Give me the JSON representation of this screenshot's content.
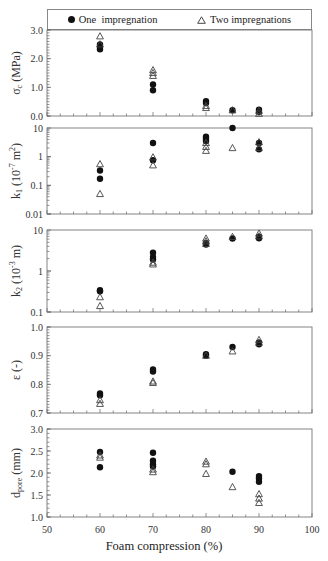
{
  "legend": {
    "series_one": "One  impregnation",
    "series_two": "Two impregnations"
  },
  "x_axis": {
    "label": "Foam compression (%)",
    "ticks": [
      "50",
      "60",
      "70",
      "80",
      "90",
      "100"
    ]
  },
  "chart_data": [
    {
      "type": "scatter",
      "title": "",
      "ylabel": "σc (MPa)",
      "xlabel": "Foam compression (%)",
      "xlim": [
        50,
        100
      ],
      "ylim": [
        0.0,
        3.0
      ],
      "yscale": "linear",
      "yticks": [
        "0.0",
        "1.0",
        "2.0",
        "3.0"
      ],
      "grid": false,
      "legend_position": "top",
      "series": [
        {
          "name": "One  impregnation",
          "marker": "filled-circle",
          "x": [
            60,
            60,
            60,
            70,
            70,
            80,
            80,
            85,
            90,
            90
          ],
          "y": [
            2.33,
            2.42,
            2.5,
            1.1,
            0.9,
            0.52,
            0.45,
            0.2,
            0.22,
            0.15
          ]
        },
        {
          "name": "Two impregnations",
          "marker": "open-triangle",
          "x": [
            60,
            60,
            70,
            70,
            70,
            80,
            80,
            85,
            90,
            90
          ],
          "y": [
            2.78,
            2.5,
            1.6,
            1.5,
            1.4,
            0.35,
            0.28,
            0.2,
            0.18,
            0.08
          ]
        }
      ]
    },
    {
      "type": "scatter",
      "ylabel": "k1 (10⁻⁷ m²)",
      "xlabel": "Foam compression (%)",
      "xlim": [
        50,
        100
      ],
      "ylim": [
        0.01,
        10
      ],
      "yscale": "log",
      "yticks": [
        "0.01",
        "0.1",
        "1",
        "10"
      ],
      "grid": false,
      "series": [
        {
          "name": "One  impregnation",
          "marker": "filled-circle",
          "x": [
            60,
            60,
            70,
            70,
            80,
            80,
            80,
            85,
            90,
            90
          ],
          "y": [
            0.33,
            0.17,
            3.0,
            0.75,
            5.0,
            4.2,
            3.5,
            10.0,
            3.0,
            1.8
          ]
        },
        {
          "name": "Two impregnations",
          "marker": "open-triangle",
          "x": [
            60,
            60,
            70,
            70,
            80,
            80,
            80,
            85,
            90,
            90
          ],
          "y": [
            0.55,
            0.05,
            0.95,
            0.5,
            3.0,
            2.2,
            1.6,
            2.0,
            3.2,
            2.0
          ]
        }
      ]
    },
    {
      "type": "scatter",
      "ylabel": "k2 (10⁻³ m)",
      "xlabel": "Foam compression (%)",
      "xlim": [
        50,
        100
      ],
      "ylim": [
        0.1,
        10
      ],
      "yscale": "log",
      "yticks": [
        "0.1",
        "1",
        "10"
      ],
      "grid": false,
      "series": [
        {
          "name": "One  impregnation",
          "marker": "filled-circle",
          "x": [
            60,
            60,
            70,
            70,
            70,
            80,
            80,
            85,
            90,
            90
          ],
          "y": [
            0.34,
            0.32,
            2.8,
            2.2,
            1.9,
            4.8,
            4.4,
            6.2,
            6.3,
            6.8
          ]
        },
        {
          "name": "Two impregnations",
          "marker": "open-triangle",
          "x": [
            60,
            60,
            70,
            70,
            80,
            80,
            80,
            85,
            90,
            90
          ],
          "y": [
            0.23,
            0.14,
            1.6,
            1.45,
            6.2,
            5.3,
            4.6,
            6.8,
            8.2,
            7.0
          ]
        }
      ]
    },
    {
      "type": "scatter",
      "ylabel": "ε (-)",
      "xlabel": "Foam compression (%)",
      "xlim": [
        50,
        100
      ],
      "ylim": [
        0.7,
        1.0
      ],
      "yscale": "linear",
      "yticks": [
        "0.7",
        "0.8",
        "0.9",
        "1.0"
      ],
      "grid": false,
      "series": [
        {
          "name": "One  impregnation",
          "marker": "filled-circle",
          "x": [
            60,
            60,
            70,
            70,
            80,
            80,
            85,
            90,
            90
          ],
          "y": [
            0.768,
            0.762,
            0.852,
            0.845,
            0.905,
            0.9,
            0.93,
            0.945,
            0.94
          ]
        },
        {
          "name": "Two impregnations",
          "marker": "open-triangle",
          "x": [
            60,
            60,
            70,
            70,
            80,
            85,
            90,
            90
          ],
          "y": [
            0.745,
            0.732,
            0.81,
            0.805,
            0.9,
            0.915,
            0.955,
            0.945
          ]
        }
      ]
    },
    {
      "type": "scatter",
      "ylabel": "dpore (mm)",
      "xlabel": "Foam compression (%)",
      "xlim": [
        50,
        100
      ],
      "ylim": [
        1.0,
        3.0
      ],
      "yscale": "linear",
      "yticks": [
        "1.0",
        "1.5",
        "2.0",
        "2.5",
        "3.0"
      ],
      "grid": false,
      "series": [
        {
          "name": "One  impregnation",
          "marker": "filled-circle",
          "x": [
            60,
            60,
            70,
            70,
            70,
            70,
            85,
            90,
            90,
            90
          ],
          "y": [
            2.48,
            2.13,
            2.46,
            2.28,
            2.2,
            2.15,
            2.03,
            1.93,
            1.88,
            1.8
          ]
        },
        {
          "name": "Two impregnations",
          "marker": "open-triangle",
          "x": [
            60,
            60,
            70,
            70,
            80,
            80,
            80,
            85,
            90,
            90,
            90
          ],
          "y": [
            2.4,
            2.35,
            2.08,
            2.02,
            2.26,
            2.2,
            1.98,
            1.68,
            1.52,
            1.42,
            1.32
          ]
        }
      ]
    }
  ],
  "panels_ylabels": {
    "p1": {
      "main": "σ",
      "sub": "c",
      "rest": " (MPa)"
    },
    "p2": {
      "main": "k",
      "sub": "1",
      "rest": " (10",
      "sup": "-7",
      "rest2": " m",
      "sup2": "2",
      "rest3": ")"
    },
    "p3": {
      "main": "k",
      "sub": "2",
      "rest": " (10",
      "sup": "-3",
      "rest2": " m)"
    },
    "p4": {
      "main": "ε (-)"
    },
    "p5": {
      "main": "d",
      "sub": "pore",
      "rest": " (mm)"
    }
  }
}
